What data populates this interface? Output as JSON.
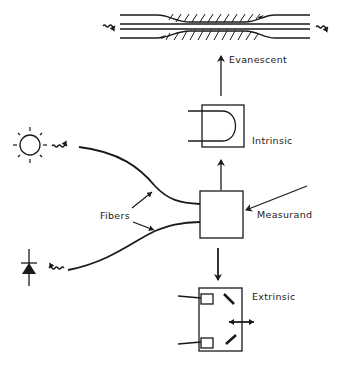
{
  "diagram": {
    "type": "fiber-optic-sensor-schematic",
    "nodes": {
      "light_source": {
        "label": "",
        "icon": "sun-light-source-icon"
      },
      "detector": {
        "label": "",
        "icon": "photodiode-detector-icon"
      },
      "sensor_box": {
        "label": ""
      },
      "evanescent": {
        "label": "Evanescent"
      },
      "intrinsic": {
        "label": "Intrinsic"
      },
      "extrinsic": {
        "label": "Extrinsic"
      }
    },
    "labels": {
      "fibers": "Fibers",
      "measurand": "Measurand",
      "evanescent": "Evanescent",
      "intrinsic": "Intrinsic",
      "extrinsic": "Extrinsic"
    },
    "edges": [
      {
        "from": "light_source",
        "to": "sensor_box",
        "via": "fiber"
      },
      {
        "from": "sensor_box",
        "to": "detector",
        "via": "fiber"
      },
      {
        "from": "measurand",
        "to": "sensor_box"
      },
      {
        "from": "sensor_box",
        "to": "intrinsic"
      },
      {
        "from": "intrinsic",
        "to": "evanescent"
      },
      {
        "from": "sensor_box",
        "to": "extrinsic"
      }
    ],
    "colors": {
      "ink": "#1a1a1a",
      "background": "#ffffff"
    }
  }
}
